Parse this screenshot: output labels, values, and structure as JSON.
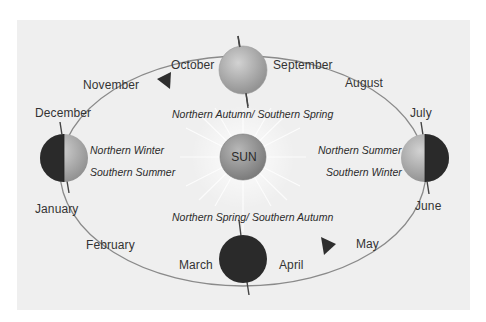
{
  "diagram": {
    "center": {
      "label": "SUN"
    },
    "months": {
      "january": "January",
      "february": "February",
      "march": "March",
      "april": "April",
      "may": "May",
      "june": "June",
      "july": "July",
      "august": "August",
      "september": "September",
      "october": "October",
      "november": "November",
      "december": "December"
    },
    "seasons": {
      "top": "Northern Autumn/ Southern Spring",
      "bottom": "Northern Spring/ Southern Autumn",
      "left_north": "Northern Winter",
      "left_south": "Southern Summer",
      "right_north": "Northern Summer",
      "right_south": "Southern Winter"
    },
    "earths": [
      {
        "position": "top",
        "phase": "lit",
        "between": [
          "October",
          "September"
        ]
      },
      {
        "position": "left",
        "phase": "left-half-dark",
        "between": [
          "December",
          "January"
        ]
      },
      {
        "position": "right",
        "phase": "right-half-dark",
        "between": [
          "July",
          "June"
        ]
      },
      {
        "position": "bottom",
        "phase": "dark",
        "between": [
          "March",
          "April"
        ]
      }
    ],
    "orbit_arrows": [
      {
        "location": "near November",
        "direction": "counter-clockwise"
      },
      {
        "location": "near May",
        "direction": "counter-clockwise"
      }
    ],
    "colors": {
      "background": "#efefef",
      "orbit": "#7a7a7a",
      "dark_side": "#2a2a2a",
      "lit_side": "#b5b5b5",
      "sun": "#8f8f8f"
    }
  }
}
